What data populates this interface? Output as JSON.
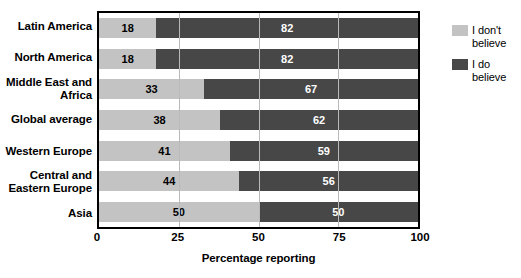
{
  "chart_data": {
    "type": "bar",
    "orientation": "horizontal",
    "stacked": true,
    "title": "",
    "xlabel": "Percentage reporting",
    "ylabel": "",
    "xlim": [
      0,
      100
    ],
    "xticks": [
      0,
      25,
      50,
      75,
      100
    ],
    "grid": true,
    "grid_axis": "x",
    "legend_position": "right",
    "categories": [
      "Latin America",
      "North America",
      "Middle East and\nAfrica",
      "Global average",
      "Western Europe",
      "Central and\nEastern Europe",
      "Asia"
    ],
    "series": [
      {
        "name": "I don't\nbelieve",
        "color": "#c3c3c3",
        "label_color": "#000000",
        "values": [
          18,
          18,
          33,
          38,
          41,
          44,
          50
        ]
      },
      {
        "name": "I do\nbelieve",
        "color": "#474747",
        "label_color": "#ffffff",
        "values": [
          82,
          82,
          67,
          62,
          59,
          56,
          50
        ]
      }
    ]
  },
  "legend": {
    "items": [
      {
        "label": "I don't\nbelieve",
        "swatch": "light"
      },
      {
        "label": "I do\nbelieve",
        "swatch": "dark"
      }
    ]
  },
  "colors": {
    "light_gray": "#c3c3c3",
    "dark_gray": "#474747",
    "gridline": "#b9b9b9",
    "axis": "#000000",
    "background": "#ffffff"
  }
}
